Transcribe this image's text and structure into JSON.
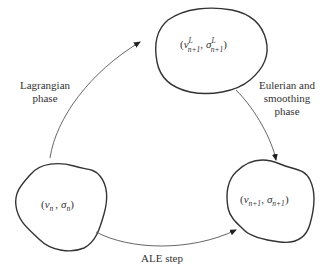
{
  "diagram": {
    "type": "cycle",
    "nodes": {
      "top": {
        "label": "(v^L_{n+1}, σ^L_{n+1})",
        "var1": "v",
        "var2": "σ",
        "sub": "n+1",
        "sup": "L",
        "open": "(",
        "close": ")",
        "comma": ","
      },
      "left": {
        "label": "(v_n, σ_n)",
        "var1": "v",
        "var2": "σ",
        "sub": "n",
        "open": "(",
        "close": ")",
        "comma": ","
      },
      "right": {
        "label": "(v_{n+1}, σ_{n+1})",
        "var1": "v",
        "var2": "σ",
        "sub": "n+1",
        "open": "(",
        "close": ")",
        "comma": ","
      }
    },
    "edges": {
      "lagrangian": {
        "from": "left",
        "to": "top",
        "line1": "Lagrangian",
        "line2": "phase"
      },
      "eulerian": {
        "from": "top",
        "to": "right",
        "line1": "Eulerian and",
        "line2": "smoothing",
        "line3": "phase"
      },
      "ale": {
        "from": "left",
        "to": "right",
        "label": "ALE step"
      }
    }
  }
}
